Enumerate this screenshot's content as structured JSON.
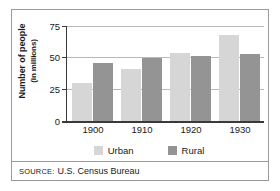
{
  "chart_data": {
    "type": "bar",
    "title": "",
    "xlabel": "",
    "ylabel": "Number of people",
    "ylabel_sub": "(in millions)",
    "categories": [
      "1900",
      "1910",
      "1920",
      "1930"
    ],
    "series": [
      {
        "name": "Urban",
        "values": [
          30,
          41,
          54,
          68
        ],
        "color": "#d6d6d6"
      },
      {
        "name": "Rural",
        "values": [
          46,
          50,
          51,
          53
        ],
        "color": "#949494"
      }
    ],
    "ylim": [
      0,
      75
    ],
    "yticks": [
      75,
      50,
      25,
      0
    ],
    "ytick_labels": [
      "75",
      "50",
      "25",
      "0"
    ],
    "grid": true,
    "grid_axis": "y",
    "legend_position": "bottom"
  },
  "source": {
    "label": "SOURCE:",
    "text": "U.S. Census Bureau"
  },
  "colors": {
    "urban": "#d6d6d6",
    "rural": "#949494",
    "axis": "#3a3a3a",
    "grid": "#b9b9b9",
    "border": "#9a9a9a",
    "text": "#1a1a1a",
    "background": "#ffffff"
  }
}
